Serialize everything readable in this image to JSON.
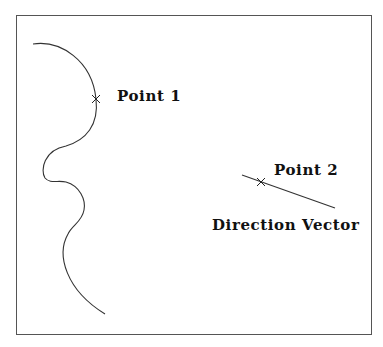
{
  "diagram": {
    "labels": {
      "point1": "Point 1",
      "point2": "Point 2",
      "direction_vector": "Direction Vector"
    },
    "elements": {
      "frame": {
        "x": 16,
        "y": 15,
        "width": 356,
        "height": 320
      },
      "curve": {
        "start": [
          33,
          44
        ],
        "end": [
          105,
          314
        ],
        "description": "free-form wavy curve"
      },
      "point1_marker": {
        "x": 96,
        "y": 99,
        "glyph": "x-mark"
      },
      "point2_marker": {
        "x": 261,
        "y": 182,
        "glyph": "x-mark"
      },
      "direction_line": {
        "from": [
          242,
          175
        ],
        "to": [
          335,
          208
        ]
      }
    },
    "colors": {
      "stroke": "#333333",
      "text": "#111111",
      "background": "#ffffff"
    }
  }
}
